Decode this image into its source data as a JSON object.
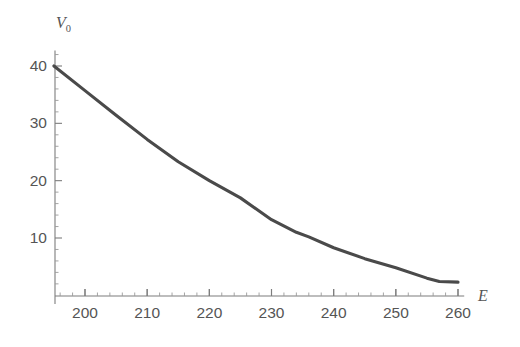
{
  "chart_data": {
    "type": "line",
    "title": "",
    "subtitle": "",
    "xlabel": "E",
    "ylabel": "V0",
    "ylabel_display": "V",
    "ylabel_subscript": "0",
    "xlim": [
      195,
      261
    ],
    "ylim": [
      0,
      42
    ],
    "grid": false,
    "legend": null,
    "x_ticks": [
      200,
      210,
      220,
      230,
      240,
      250,
      260
    ],
    "x_tick_labels": [
      "200",
      "210",
      "220",
      "230",
      "240",
      "250",
      "260"
    ],
    "x_minor_step": 2,
    "y_ticks": [
      10,
      20,
      30,
      40
    ],
    "y_tick_labels": [
      "10",
      "20",
      "30",
      "40"
    ],
    "y_minor_step": 2,
    "series": [
      {
        "name": "V0(E)",
        "color": "#4a4a4a",
        "x": [
          195,
          200,
          205,
          210,
          215,
          220,
          225,
          230,
          234,
          236,
          240,
          245,
          250,
          255,
          257,
          260
        ],
        "values": [
          40.0,
          35.7,
          31.4,
          27.2,
          23.3,
          20.0,
          17.0,
          13.2,
          11.0,
          10.2,
          8.3,
          6.4,
          4.8,
          3.0,
          2.4,
          2.3
        ]
      }
    ],
    "annotations": []
  },
  "axes": {
    "x_axis_name": "E",
    "y_axis_name": "V"
  }
}
